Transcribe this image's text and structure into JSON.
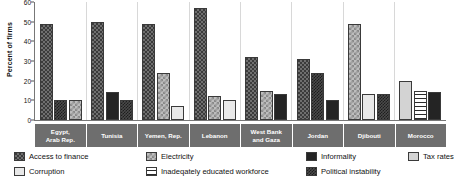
{
  "chart_data": {
    "type": "bar",
    "title": "",
    "xlabel": "",
    "ylabel": "Percent of firms",
    "ylim": [
      0,
      60
    ],
    "yticks": [
      0,
      10,
      20,
      30,
      40,
      50,
      60
    ],
    "grid": false,
    "legend_position": "bottom",
    "categories": [
      "Egypt, Arab Rep.",
      "Tunisia",
      "Yemen, Rep.",
      "Lebanon",
      "West Bank and Gaza",
      "Jordan",
      "Djibouti",
      "Morocco"
    ],
    "legend": [
      "Access to finance",
      "Corruption",
      "Electricity",
      "Inadeqately educated workforce",
      "Informality",
      "Political instability",
      "Tax rates"
    ],
    "groups": [
      {
        "category": "Egypt, Arab Rep.",
        "bars": [
          {
            "series": "Access to finance",
            "value": 49
          },
          {
            "series": "Political instability",
            "value": 10
          },
          {
            "series": "Electricity",
            "value": 10
          }
        ]
      },
      {
        "category": "Tunisia",
        "bars": [
          {
            "series": "Access to finance",
            "value": 50
          },
          {
            "series": "Informality",
            "value": 14
          },
          {
            "series": "Political instability",
            "value": 10
          }
        ]
      },
      {
        "category": "Yemen, Rep.",
        "bars": [
          {
            "series": "Access to finance",
            "value": 49
          },
          {
            "series": "Electricity",
            "value": 24
          },
          {
            "series": "Corruption",
            "value": 7
          }
        ]
      },
      {
        "category": "Lebanon",
        "bars": [
          {
            "series": "Access to finance",
            "value": 57
          },
          {
            "series": "Electricity",
            "value": 12
          },
          {
            "series": "Corruption",
            "value": 10
          }
        ]
      },
      {
        "category": "West Bank and Gaza",
        "bars": [
          {
            "series": "Access to finance",
            "value": 32
          },
          {
            "series": "Electricity",
            "value": 15
          },
          {
            "series": "Informality",
            "value": 13
          }
        ]
      },
      {
        "category": "Jordan",
        "bars": [
          {
            "series": "Access to finance",
            "value": 31
          },
          {
            "series": "Political instability",
            "value": 24
          },
          {
            "series": "Informality",
            "value": 10
          }
        ]
      },
      {
        "category": "Djibouti",
        "bars": [
          {
            "series": "Electricity",
            "value": 49
          },
          {
            "series": "Corruption",
            "value": 13
          },
          {
            "series": "Political instability",
            "value": 13
          }
        ]
      },
      {
        "category": "Morocco",
        "bars": [
          {
            "series": "Tax rates",
            "value": 20
          },
          {
            "series": "Inadeqately educated workforce",
            "value": 15
          },
          {
            "series": "Informality",
            "value": 14
          }
        ]
      }
    ]
  },
  "axis": {
    "ylabel": "Percent of firms",
    "ticks": [
      "60",
      "50",
      "40",
      "30",
      "20",
      "10",
      "0"
    ]
  },
  "legend": {
    "col1": [
      {
        "label": "Access to finance",
        "pattern": "p-finance"
      },
      {
        "label": "Corruption",
        "pattern": "p-corruption"
      }
    ],
    "col2": [
      {
        "label": "Electricity",
        "pattern": "p-electricity"
      },
      {
        "label": "Inadeqately educated workforce",
        "pattern": "p-workforce"
      }
    ],
    "col3": [
      {
        "label": "Informality",
        "pattern": "p-informality"
      },
      {
        "label": "Political instability",
        "pattern": "p-instability"
      }
    ],
    "col4": [
      {
        "label": "Tax rates",
        "pattern": "p-taxrates"
      }
    ]
  }
}
